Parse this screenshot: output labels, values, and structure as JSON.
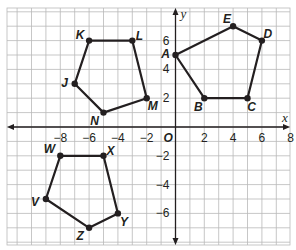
{
  "chart_data": {
    "type": "scatter",
    "title": "",
    "xlabel": "x",
    "ylabel": "y",
    "origin_label": "O",
    "xlim": [
      -10,
      8.5
    ],
    "ylim": [
      -7.5,
      8.5
    ],
    "grid": true,
    "x_ticks": [
      -8,
      -6,
      -4,
      -2,
      2,
      4,
      6,
      8
    ],
    "y_ticks": [
      -6,
      -4,
      -2,
      2,
      4,
      6
    ],
    "polygons": [
      {
        "name": "ABCDE",
        "vertices": [
          {
            "label": "A",
            "x": 0,
            "y": 5
          },
          {
            "label": "B",
            "x": 2,
            "y": 2
          },
          {
            "label": "C",
            "x": 5,
            "y": 2
          },
          {
            "label": "D",
            "x": 6,
            "y": 6
          },
          {
            "label": "E",
            "x": 4,
            "y": 7
          }
        ]
      },
      {
        "name": "JKLMN",
        "vertices": [
          {
            "label": "J",
            "x": -7,
            "y": 3
          },
          {
            "label": "K",
            "x": -6,
            "y": 6
          },
          {
            "label": "L",
            "x": -3,
            "y": 6
          },
          {
            "label": "M",
            "x": -2,
            "y": 2
          },
          {
            "label": "N",
            "x": -5,
            "y": 1
          }
        ]
      },
      {
        "name": "VWXYZ",
        "vertices": [
          {
            "label": "V",
            "x": -9,
            "y": -5
          },
          {
            "label": "W",
            "x": -8,
            "y": -2
          },
          {
            "label": "X",
            "x": -5,
            "y": -2
          },
          {
            "label": "Y",
            "x": -4,
            "y": -6
          },
          {
            "label": "Z",
            "x": -6,
            "y": -7
          }
        ]
      }
    ]
  },
  "colors": {
    "grid": "#b9b9b9",
    "axis": "#231f20",
    "polygon": "#231f20",
    "background": "#ffffff"
  }
}
